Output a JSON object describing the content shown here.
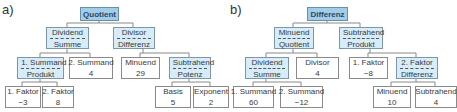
{
  "diagrams": [
    {
      "label": "a)",
      "nodes": {
        "root": {
          "top": "Quotient"
        },
        "n1": {
          "top": "Dividend",
          "bottom": "Summe"
        },
        "n2": {
          "top": "Divisor",
          "bottom": "Differenz"
        },
        "n3": {
          "top": "1. Summand",
          "bottom": "Produkt"
        },
        "n4": {
          "top": "2. Summand",
          "bottom": "4"
        },
        "n5": {
          "top": "Minuend",
          "bottom": "29"
        },
        "n6": {
          "top": "Subtrahend",
          "bottom": "Potenz"
        },
        "n7": {
          "top": "1. Faktor",
          "bottom": "−3"
        },
        "n8": {
          "top": "2. Faktor",
          "bottom": "8"
        },
        "n9": {
          "top": "Basis",
          "bottom": "5"
        },
        "n10": {
          "top": "Exponent",
          "bottom": "2"
        }
      }
    },
    {
      "label": "b)",
      "nodes": {
        "root": {
          "top": "Differenz"
        },
        "n1": {
          "top": "Minuend",
          "bottom": "Quotient"
        },
        "n2": {
          "top": "Subtrahend",
          "bottom": "Produkt"
        },
        "n3": {
          "top": "Dividend",
          "bottom": "Summe"
        },
        "n4": {
          "top": "Divisor",
          "bottom": "4"
        },
        "n5": {
          "top": "1. Faktor",
          "bottom": "−8"
        },
        "n6": {
          "top": "2. Faktor",
          "bottom": "Differenz"
        },
        "n7": {
          "top": "1. Summand",
          "bottom": "60"
        },
        "n8": {
          "top": "2. Summand",
          "bottom": "−12"
        },
        "n9": {
          "top": "Minuend",
          "bottom": "10"
        },
        "n10": {
          "top": "Subtrahend",
          "bottom": "4"
        }
      }
    }
  ],
  "colors": {
    "root_fill": "#9fcdea",
    "expression_fill": "#d6ecf8",
    "leaf_fill": "#ffffff",
    "border": "#8a8a8a"
  }
}
